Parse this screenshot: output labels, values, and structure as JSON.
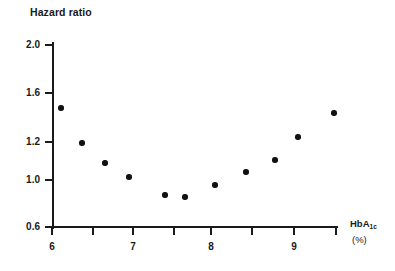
{
  "chart_data": {
    "type": "scatter",
    "title": "Hazard ratio",
    "xlabel": "HbA1c (%)",
    "xlabel_main": "HbA",
    "xlabel_sub": "1c",
    "xlabel_units": "(%)",
    "ylabel": "Hazard ratio",
    "grid": false,
    "legend": "none",
    "xlim": [
      5.85,
      9.6
    ],
    "ylim": [
      0.6,
      2.0
    ],
    "y_scale": "nonlinear",
    "xticks": [
      6,
      6.5,
      7,
      7.5,
      8,
      8.5,
      9,
      9.5
    ],
    "xtick_labels": [
      "6",
      "",
      "7",
      "",
      "8",
      "",
      "9",
      ""
    ],
    "yticks": [
      0.6,
      1.0,
      1.2,
      1.6,
      2.0
    ],
    "ytick_labels": [
      "0.6",
      "1.0",
      "1.2",
      "1.6",
      "2.0"
    ],
    "marker": "filled-circle",
    "marker_color": "#111111",
    "axis_color": "#1a1a1a",
    "background_color": "#ffffff",
    "x": [
      6.12,
      6.38,
      6.64,
      6.93,
      7.4,
      7.63,
      8.01,
      8.4,
      8.73,
      9.01,
      9.45
    ],
    "y": [
      1.47,
      1.19,
      1.11,
      1.05,
      0.96,
      0.94,
      1.02,
      1.08,
      1.12,
      1.22,
      1.42
    ],
    "points": [
      {
        "x": 6.12,
        "y": 1.47,
        "px": 61,
        "py": 108
      },
      {
        "x": 6.38,
        "y": 1.19,
        "px": 82,
        "py": 143
      },
      {
        "x": 6.64,
        "y": 1.11,
        "px": 105,
        "py": 163
      },
      {
        "x": 6.93,
        "y": 1.05,
        "px": 129,
        "py": 177
      },
      {
        "x": 7.4,
        "y": 0.96,
        "px": 165,
        "py": 195
      },
      {
        "x": 7.63,
        "y": 0.94,
        "px": 185,
        "py": 197
      },
      {
        "x": 8.01,
        "y": 1.02,
        "px": 215,
        "py": 185
      },
      {
        "x": 8.4,
        "y": 1.08,
        "px": 246,
        "py": 172
      },
      {
        "x": 8.73,
        "y": 1.12,
        "px": 275,
        "py": 160
      },
      {
        "x": 9.01,
        "y": 1.22,
        "px": 298,
        "py": 137
      },
      {
        "x": 9.45,
        "y": 1.42,
        "px": 334,
        "py": 113
      }
    ],
    "ytick_pixels": [
      {
        "value": "2.0",
        "py": 45
      },
      {
        "value": "1.6",
        "py": 93
      },
      {
        "value": "1.2",
        "py": 142
      },
      {
        "value": "1.0",
        "py": 180
      },
      {
        "value": "0.6",
        "py": 227
      }
    ],
    "xtick_pixels": [
      {
        "value": "6",
        "px": 52,
        "labeled": true
      },
      {
        "value": "",
        "px": 93,
        "labeled": false
      },
      {
        "value": "7",
        "px": 133,
        "labeled": true
      },
      {
        "value": "",
        "px": 174,
        "labeled": false
      },
      {
        "value": "8",
        "px": 211,
        "labeled": true
      },
      {
        "value": "",
        "px": 252,
        "labeled": false
      },
      {
        "value": "9",
        "px": 294,
        "labeled": true
      },
      {
        "value": "",
        "px": 336,
        "labeled": false
      }
    ]
  }
}
